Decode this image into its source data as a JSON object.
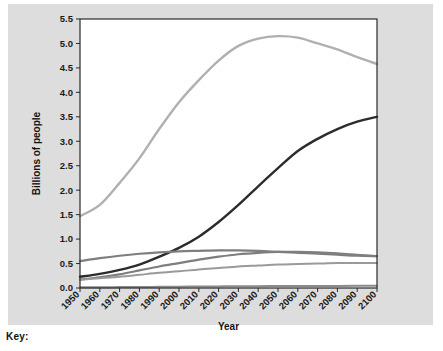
{
  "key": {
    "label": "Key:"
  },
  "chart_data": {
    "type": "line",
    "title": "",
    "xlabel": "Year",
    "ylabel": "Billions of people",
    "xlim": [
      1950,
      2100
    ],
    "ylim": [
      0.0,
      5.5
    ],
    "grid": false,
    "legend": "none",
    "x": [
      1950,
      1960,
      1970,
      1980,
      1990,
      2000,
      2010,
      2020,
      2030,
      2040,
      2050,
      2060,
      2070,
      2080,
      2090,
      2100
    ],
    "xtick_labels": [
      "1950",
      "1960",
      "1970",
      "1980",
      "1990",
      "2000",
      "2010",
      "2020",
      "2030",
      "2040",
      "2050",
      "2060",
      "2070",
      "2080",
      "2090",
      "2100"
    ],
    "ytick_labels": [
      "0.0",
      "0.5",
      "1.0",
      "1.5",
      "2.0",
      "2.5",
      "3.0",
      "3.5",
      "4.0",
      "4.5",
      "5.0",
      "5.5"
    ],
    "ytick_values": [
      0.0,
      0.5,
      1.0,
      1.5,
      2.0,
      2.5,
      3.0,
      3.5,
      4.0,
      4.5,
      5.0,
      5.5
    ],
    "series": [
      {
        "name": "series-1",
        "color": "#b0b0b0",
        "width": 2.4,
        "values": [
          1.47,
          1.7,
          2.15,
          2.65,
          3.25,
          3.8,
          4.25,
          4.65,
          4.95,
          5.1,
          5.15,
          5.12,
          5.0,
          4.88,
          4.72,
          4.58
        ]
      },
      {
        "name": "series-2",
        "color": "#2c2c2c",
        "width": 2.4,
        "values": [
          0.23,
          0.29,
          0.37,
          0.48,
          0.64,
          0.82,
          1.05,
          1.35,
          1.7,
          2.08,
          2.45,
          2.8,
          3.05,
          3.25,
          3.4,
          3.5
        ]
      },
      {
        "name": "series-3",
        "color": "#7e7e7e",
        "width": 2.2,
        "values": [
          0.55,
          0.61,
          0.66,
          0.7,
          0.73,
          0.75,
          0.76,
          0.77,
          0.77,
          0.76,
          0.74,
          0.72,
          0.7,
          0.68,
          0.66,
          0.65
        ]
      },
      {
        "name": "series-4",
        "color": "#7e7e7e",
        "width": 2.2,
        "values": [
          0.17,
          0.22,
          0.28,
          0.36,
          0.44,
          0.51,
          0.58,
          0.64,
          0.69,
          0.72,
          0.74,
          0.74,
          0.73,
          0.71,
          0.68,
          0.65
        ]
      },
      {
        "name": "series-5",
        "color": "#9a9a9a",
        "width": 2.0,
        "values": [
          0.17,
          0.2,
          0.23,
          0.27,
          0.31,
          0.34,
          0.38,
          0.41,
          0.44,
          0.46,
          0.48,
          0.49,
          0.5,
          0.51,
          0.51,
          0.51
        ]
      },
      {
        "name": "series-6",
        "color": "#8a8a8a",
        "width": 2.0,
        "values": [
          0.013,
          0.015,
          0.018,
          0.021,
          0.024,
          0.027,
          0.03,
          0.033,
          0.036,
          0.038,
          0.04,
          0.041,
          0.042,
          0.043,
          0.044,
          0.045
        ]
      }
    ]
  }
}
